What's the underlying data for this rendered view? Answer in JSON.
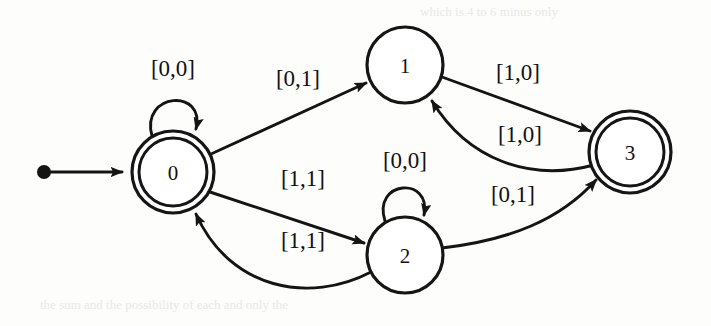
{
  "diagram": {
    "type": "state-transition-diagram",
    "background_color": "#fdfdfc",
    "ink_color": "#141414",
    "states": [
      {
        "id": "0",
        "label": "0",
        "cx": 173,
        "cy": 172,
        "r": 41,
        "accepting": true,
        "start": true
      },
      {
        "id": "1",
        "label": "1",
        "cx": 405,
        "cy": 65,
        "r": 38,
        "accepting": false,
        "start": false
      },
      {
        "id": "2",
        "label": "2",
        "cx": 405,
        "cy": 255,
        "r": 38,
        "accepting": false,
        "start": false
      },
      {
        "id": "3",
        "label": "3",
        "cx": 630,
        "cy": 152,
        "r": 41,
        "accepting": true,
        "start": false
      }
    ],
    "transitions": [
      {
        "id": "t-0-0",
        "from": "0",
        "to": "0",
        "label": "[0,0]",
        "label_x": 173,
        "label_y": 68,
        "kind": "self-loop"
      },
      {
        "id": "t-0-1",
        "from": "0",
        "to": "1",
        "label": "[0,1]",
        "label_x": 298,
        "label_y": 78,
        "kind": "straight"
      },
      {
        "id": "t-0-2",
        "from": "0",
        "to": "2",
        "label": "[1,1]",
        "label_x": 303,
        "label_y": 178,
        "kind": "straight"
      },
      {
        "id": "t-2-0",
        "from": "2",
        "to": "0",
        "label": "[1,1]",
        "label_x": 303,
        "label_y": 240,
        "kind": "curved"
      },
      {
        "id": "t-2-2",
        "from": "2",
        "to": "2",
        "label": "[0,0]",
        "label_x": 405,
        "label_y": 160,
        "kind": "self-loop"
      },
      {
        "id": "t-1-3",
        "from": "1",
        "to": "3",
        "label": "[1,0]",
        "label_x": 518,
        "label_y": 72,
        "kind": "straight"
      },
      {
        "id": "t-3-1",
        "from": "3",
        "to": "1",
        "label": "[1,0]",
        "label_x": 520,
        "label_y": 134,
        "kind": "curved"
      },
      {
        "id": "t-2-3",
        "from": "2",
        "to": "3",
        "label": "[0,1]",
        "label_x": 513,
        "label_y": 194,
        "kind": "curved"
      }
    ],
    "start_marker": {
      "id": "start-arrow",
      "dot_x": 44,
      "dot_y": 172,
      "tip_x": 131,
      "tip_y": 172
    },
    "alphabet_note": "",
    "scan_artifacts": [
      {
        "text": "which is 4 to 6 minus only",
        "x": 420,
        "y": 10
      },
      {
        "text": "the sum and the possibility of each and only the",
        "x": 40,
        "y": 303
      }
    ]
  }
}
